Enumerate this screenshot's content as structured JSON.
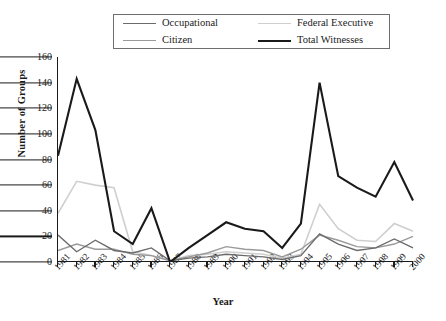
{
  "chart_data": {
    "type": "line",
    "title": "",
    "xlabel": "Year",
    "ylabel": "Number of Groups",
    "ylim": [
      0,
      160
    ],
    "yticks": [
      0,
      20,
      40,
      60,
      80,
      100,
      120,
      140,
      160
    ],
    "grid": false,
    "legend_position": "top-center",
    "categories": [
      "1981",
      "1982",
      "1983",
      "1984",
      "1985",
      "1986",
      "1987",
      "1988",
      "1989",
      "1990",
      "1991",
      "1992",
      "1993",
      "1994",
      "1995",
      "1996",
      "1997",
      "1998",
      "1999",
      "2000"
    ],
    "series": [
      {
        "name": "Occupational",
        "color": "#6b6b6b",
        "width": 1.4,
        "values": [
          21,
          8,
          17,
          9,
          7,
          11,
          1,
          3,
          4,
          6,
          5,
          4,
          2,
          5,
          22,
          14,
          9,
          11,
          18,
          11
        ]
      },
      {
        "name": "Citizen",
        "color": "#9a9a9a",
        "width": 1.4,
        "values": [
          9,
          14,
          10,
          10,
          6,
          5,
          1,
          4,
          7,
          12,
          10,
          9,
          4,
          10,
          21,
          17,
          12,
          11,
          14,
          20
        ]
      },
      {
        "name": "Federal Executive",
        "color": "#cfcfcf",
        "width": 1.6,
        "values": [
          38,
          63,
          60,
          58,
          8,
          5,
          1,
          5,
          6,
          8,
          7,
          6,
          3,
          6,
          45,
          26,
          17,
          16,
          30,
          24
        ]
      },
      {
        "name": "Total Witnesses",
        "color": "#1a1a1a",
        "width": 2.1,
        "values": [
          83,
          143,
          103,
          24,
          14,
          42,
          0,
          11,
          21,
          31,
          26,
          24,
          11,
          30,
          140,
          67,
          58,
          51,
          78,
          48
        ]
      }
    ]
  },
  "legend": {
    "items": [
      {
        "label": "Occupational",
        "color": "#6b6b6b",
        "width": 1.6
      },
      {
        "label": "Federal Executive",
        "color": "#cfcfcf",
        "width": 1.8
      },
      {
        "label": "Citizen",
        "color": "#9a9a9a",
        "width": 1.6
      },
      {
        "label": "Total Witnesses",
        "color": "#1a1a1a",
        "width": 2.4
      }
    ]
  }
}
